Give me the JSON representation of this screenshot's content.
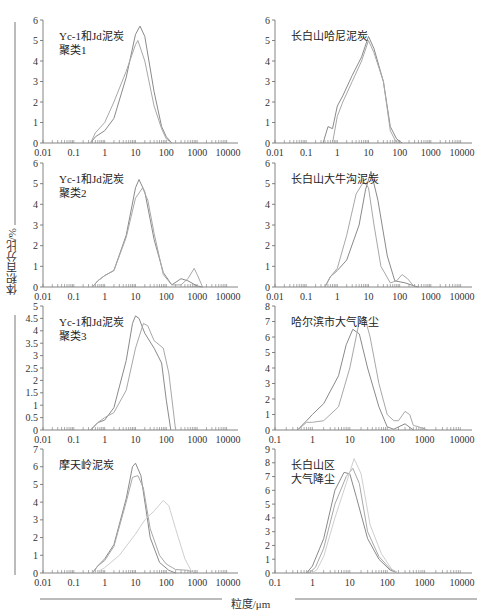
{
  "figure": {
    "ylabel": "体积百分比/%",
    "xlabel": "粒度/μm"
  },
  "chart_data": [
    {
      "type": "line",
      "panel": "top-left",
      "title": "Yc-1和Jd泥炭聚类1",
      "title_lines": [
        "Yc-1和Jd泥炭",
        "聚类1"
      ],
      "xscale": "log",
      "xlim": [
        0.01,
        10000
      ],
      "xticks": [
        "0.01",
        "0.1",
        "1",
        "10",
        "100",
        "1000",
        "10000"
      ],
      "ylim": [
        0,
        6
      ],
      "yticks": [
        "0",
        "1",
        "2",
        "3",
        "4",
        "5",
        "6"
      ],
      "series": [
        {
          "name": "curve-a",
          "x": [
            0.35,
            0.5,
            1,
            2,
            5,
            10,
            14,
            20,
            40,
            70,
            100,
            150
          ],
          "y": [
            0,
            0.3,
            0.6,
            1.2,
            3.2,
            5.3,
            5.7,
            5.2,
            2.5,
            0.8,
            0.3,
            0
          ]
        },
        {
          "name": "curve-b",
          "x": [
            0.35,
            0.5,
            1,
            2,
            5,
            10,
            12,
            20,
            40,
            70,
            100,
            150
          ],
          "y": [
            0,
            0.5,
            1.0,
            2.0,
            3.5,
            4.8,
            5.0,
            4.0,
            1.8,
            0.7,
            0.2,
            0
          ]
        }
      ]
    },
    {
      "type": "line",
      "panel": "top-right",
      "title": "长白山哈尼泥炭",
      "title_lines": [
        "长白山哈尼泥炭"
      ],
      "xscale": "log",
      "xlim": [
        0.01,
        10000
      ],
      "xticks": [
        "0.01",
        "0.1",
        "1",
        "10",
        "100",
        "1000",
        "10000"
      ],
      "ylim": [
        0,
        6
      ],
      "yticks": [
        "0",
        "1",
        "2",
        "3",
        "4",
        "5",
        "6"
      ],
      "series": [
        {
          "name": "curve-a",
          "x": [
            0.35,
            0.5,
            0.7,
            1,
            1.5,
            3,
            6,
            10,
            15,
            30,
            50,
            80,
            120
          ],
          "y": [
            0,
            0.8,
            0.7,
            1.8,
            2.3,
            3.3,
            4.2,
            5.2,
            4.6,
            3.0,
            0.8,
            0.2,
            0
          ]
        },
        {
          "name": "curve-b",
          "x": [
            0.7,
            1,
            1.5,
            3,
            6,
            10,
            15,
            30,
            50,
            80
          ],
          "y": [
            0,
            1.3,
            2.0,
            3.0,
            4.0,
            5.0,
            4.4,
            3.0,
            0.6,
            0
          ]
        }
      ]
    },
    {
      "type": "line",
      "panel": "row2-left",
      "title": "Yc-1和Jd泥炭聚类2",
      "title_lines": [
        "Yc-1和Jd泥炭",
        "聚类2"
      ],
      "xscale": "log",
      "xlim": [
        0.01,
        10000
      ],
      "xticks": [
        "0.01",
        "0.1",
        "1",
        "10",
        "100",
        "1000",
        "10000"
      ],
      "ylim": [
        0,
        6
      ],
      "yticks": [
        "0",
        "1",
        "2",
        "3",
        "4",
        "5",
        "6"
      ],
      "series": [
        {
          "name": "curve-a",
          "x": [
            0.4,
            0.6,
            1,
            2,
            5,
            10,
            13,
            20,
            40,
            80,
            150,
            300,
            500,
            1000,
            1500
          ],
          "y": [
            0,
            0.3,
            0.55,
            0.8,
            2.5,
            4.8,
            5.2,
            4.6,
            2.3,
            0.7,
            0.1,
            0.4,
            0.3,
            0.05,
            0
          ]
        },
        {
          "name": "curve-b",
          "x": [
            0.4,
            0.6,
            1,
            2,
            5,
            10,
            17,
            25,
            40,
            80,
            150,
            300,
            500,
            800,
            1000,
            1500
          ],
          "y": [
            0,
            0.3,
            0.55,
            0.8,
            2.4,
            4.3,
            4.8,
            4.2,
            2.6,
            0.6,
            0.1,
            0.1,
            0.4,
            0.9,
            0.6,
            0
          ]
        }
      ]
    },
    {
      "type": "line",
      "panel": "row2-right",
      "title": "长白山大牛沟泥炭",
      "title_lines": [
        "长白山大牛沟泥炭"
      ],
      "xscale": "log",
      "xlim": [
        0.01,
        10000
      ],
      "xticks": [
        "0.01",
        "0.1",
        "1",
        "10",
        "100",
        "1000",
        "10000"
      ],
      "ylim": [
        0,
        6
      ],
      "yticks": [
        "0",
        "1",
        "2",
        "3",
        "4",
        "5",
        "6"
      ],
      "series": [
        {
          "name": "curve-a",
          "x": [
            0.4,
            0.6,
            1,
            2,
            5,
            8,
            12,
            20,
            40,
            70,
            150,
            300,
            400
          ],
          "y": [
            0,
            0.5,
            0.8,
            1.3,
            3.0,
            4.7,
            5.6,
            4.2,
            1.5,
            0.3,
            0.2,
            0.05,
            0
          ]
        },
        {
          "name": "curve-b",
          "x": [
            0.4,
            0.6,
            1,
            2,
            4,
            7,
            10,
            15,
            25,
            50,
            80,
            120,
            180,
            300
          ],
          "y": [
            0,
            0.5,
            0.9,
            2.5,
            4.5,
            5.1,
            4.8,
            3.0,
            1.0,
            0.2,
            0.3,
            0.6,
            0.4,
            0
          ]
        }
      ]
    },
    {
      "type": "line",
      "panel": "row3-left",
      "title": "Yc-1和Jd泥炭聚类3",
      "title_lines": [
        "Yc-1和Jd泥炭",
        "聚类3"
      ],
      "xscale": "log",
      "xlim": [
        0.01,
        10000
      ],
      "xticks": [
        "0.01",
        "0.1",
        "1",
        "10",
        "100",
        "1000",
        "10000"
      ],
      "ylim": [
        0,
        5
      ],
      "yticks": [
        "0",
        "0.5",
        "1",
        "1.5",
        "2",
        "2.5",
        "3",
        "3.5",
        "4",
        "4.5",
        "5"
      ],
      "series": [
        {
          "name": "curve-a",
          "x": [
            0.35,
            0.6,
            1,
            2,
            5,
            8,
            10,
            13,
            20,
            40,
            70,
            100,
            140
          ],
          "y": [
            0,
            0.3,
            0.4,
            0.9,
            2.8,
            4.3,
            4.6,
            4.5,
            3.9,
            3.3,
            2.7,
            1.2,
            0
          ]
        },
        {
          "name": "curve-b",
          "x": [
            0.35,
            0.6,
            1,
            2,
            5,
            10,
            18,
            25,
            40,
            80,
            120,
            200
          ],
          "y": [
            0,
            0.3,
            0.5,
            0.7,
            1.6,
            3.3,
            4.3,
            4.2,
            3.6,
            3.3,
            2.3,
            0
          ]
        }
      ]
    },
    {
      "type": "line",
      "panel": "row3-right",
      "title": "哈尔滨市大气降尘",
      "title_lines": [
        "哈尔滨市大气降尘"
      ],
      "xscale": "log",
      "xlim": [
        0.1,
        10000
      ],
      "xticks": [
        "0.1",
        "1",
        "10",
        "100",
        "1000",
        "10000"
      ],
      "ylim": [
        0,
        8
      ],
      "yticks": [
        "0",
        "1",
        "2",
        "3",
        "4",
        "5",
        "6",
        "7",
        "8"
      ],
      "series": [
        {
          "name": "curve-a",
          "x": [
            0.4,
            0.7,
            1,
            2,
            5,
            8,
            12,
            18,
            30,
            60,
            100,
            150,
            300,
            500
          ],
          "y": [
            0,
            0.6,
            1.0,
            1.7,
            3.5,
            5.5,
            6.5,
            6.2,
            4.0,
            1.5,
            0.2,
            0.05,
            0.4,
            0
          ]
        },
        {
          "name": "curve-b",
          "x": [
            0.4,
            0.7,
            1,
            2,
            5,
            10,
            18,
            25,
            35,
            60,
            100,
            150,
            200,
            300,
            400,
            500,
            700,
            1200
          ],
          "y": [
            0,
            0.5,
            0.5,
            0.6,
            1.5,
            4.0,
            7.0,
            7.3,
            6.0,
            3.0,
            1.0,
            0.6,
            0.6,
            1.2,
            1.0,
            0.3,
            0.2,
            0
          ]
        }
      ]
    },
    {
      "type": "line",
      "panel": "bottom-left",
      "title": "摩天岭泥炭",
      "title_lines": [
        "摩天岭泥炭"
      ],
      "xscale": "log",
      "xlim": [
        0.01,
        10000
      ],
      "xticks": [
        "0.01",
        "0.1",
        "1",
        "10",
        "100",
        "1000",
        "10000"
      ],
      "ylim": [
        0,
        7
      ],
      "yticks": [
        "0",
        "1",
        "2",
        "3",
        "4",
        "5",
        "6",
        "7"
      ],
      "series": [
        {
          "name": "curve-a",
          "x": [
            0.4,
            0.6,
            1,
            2,
            5,
            8,
            10,
            15,
            30,
            60,
            120,
            200
          ],
          "y": [
            0,
            0.4,
            0.8,
            1.6,
            4.2,
            6.0,
            6.2,
            5.5,
            2.0,
            0.6,
            0.15,
            0
          ]
        },
        {
          "name": "curve-b",
          "x": [
            0.4,
            0.6,
            1,
            2,
            5,
            8,
            12,
            18,
            30,
            60,
            100,
            200,
            500,
            800
          ],
          "y": [
            0,
            0.4,
            0.7,
            1.5,
            4.0,
            5.4,
            5.5,
            4.8,
            2.5,
            1.0,
            0.5,
            0.2,
            0.15,
            0
          ]
        },
        {
          "name": "curve-c",
          "x": [
            0.5,
            1,
            3,
            10,
            20,
            40,
            80,
            120,
            200,
            400,
            700
          ],
          "y": [
            0,
            0.3,
            1.0,
            2.2,
            3.0,
            3.5,
            4.1,
            3.8,
            2.5,
            0.8,
            0
          ]
        }
      ]
    },
    {
      "type": "line",
      "panel": "bottom-right",
      "title": "长白山区大气降尘",
      "title_lines": [
        "长白山区",
        "大气降尘"
      ],
      "xscale": "log",
      "xlim": [
        0.1,
        10000
      ],
      "xticks": [
        "0.1",
        "1",
        "10",
        "100",
        "1000",
        "10000"
      ],
      "ylim": [
        0,
        9
      ],
      "yticks": [
        "0",
        "1",
        "2",
        "3",
        "4",
        "5",
        "6",
        "7",
        "8",
        "9"
      ],
      "series": [
        {
          "name": "curve-a",
          "x": [
            0.7,
            1,
            2,
            4,
            7,
            10,
            15,
            30,
            60,
            120,
            200
          ],
          "y": [
            0,
            0.5,
            2.5,
            6.0,
            7.3,
            7.2,
            5.5,
            2.5,
            1.0,
            0.2,
            0
          ]
        },
        {
          "name": "curve-b",
          "x": [
            0.8,
            1.2,
            2,
            4,
            8,
            12,
            18,
            30,
            60,
            120,
            200
          ],
          "y": [
            0,
            0.4,
            1.8,
            5.0,
            7.0,
            7.6,
            6.5,
            3.0,
            1.2,
            0.3,
            0
          ]
        },
        {
          "name": "curve-c",
          "x": [
            0.9,
            1.3,
            2,
            4,
            8,
            13,
            20,
            35,
            70,
            130,
            200
          ],
          "y": [
            0,
            0.2,
            1.2,
            4.0,
            6.5,
            8.3,
            7.2,
            3.5,
            1.4,
            0.3,
            0
          ]
        }
      ]
    }
  ]
}
